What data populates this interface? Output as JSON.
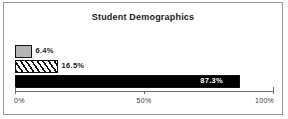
{
  "chart_data": {
    "type": "bar",
    "orientation": "horizontal",
    "title": "Student Demographics",
    "xlabel": "",
    "ylabel": "",
    "categories": [
      "series-1",
      "series-2",
      "series-3"
    ],
    "values": [
      6.4,
      16.5,
      87.3
    ],
    "data_labels": [
      "6.4%",
      "16.5%",
      "87.3%"
    ],
    "bar_styles": [
      "gray-fill",
      "diagonal-hatch",
      "black-fill"
    ],
    "label_placement": [
      "outside",
      "outside",
      "inside"
    ],
    "xlim": [
      0,
      100
    ],
    "xticks": [
      0,
      50,
      100
    ],
    "xtick_labels": [
      "0%",
      "50%",
      "100%"
    ],
    "grid": false,
    "legend": false,
    "colors": {
      "bar_gray": "#b4b4b4",
      "bar_black": "#000000",
      "bar_outline": "#111111",
      "axis": "#6d6d6d",
      "frame": "#9a9a9a",
      "title_text": "#1a1a1a",
      "label_text_light": "#ffffff"
    }
  }
}
